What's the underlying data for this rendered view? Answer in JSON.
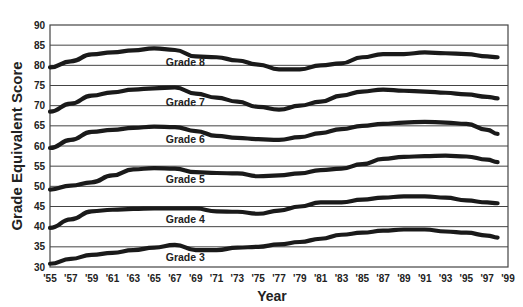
{
  "chart_data": {
    "type": "line",
    "title": "",
    "xlabel": "Year",
    "ylabel": "Grade Equivalent Score",
    "ylim": [
      30,
      90
    ],
    "yticks": [
      30,
      35,
      40,
      45,
      50,
      55,
      60,
      65,
      70,
      75,
      80,
      85,
      90
    ],
    "xticks": [
      "'55",
      "'57",
      "'59",
      "'61",
      "'63",
      "'65",
      "'67",
      "'69",
      "'71",
      "'73",
      "'75",
      "'77",
      "'79",
      "'81",
      "'83",
      "'85",
      "'87",
      "'89",
      "'91",
      "'93",
      "'95",
      "'97",
      "'99"
    ],
    "xlim": [
      1955,
      1999
    ],
    "grid": "horizontal",
    "legend": "inline labels",
    "x": [
      1955,
      1957,
      1959,
      1961,
      1963,
      1965,
      1967,
      1969,
      1971,
      1973,
      1975,
      1977,
      1979,
      1981,
      1983,
      1985,
      1987,
      1989,
      1991,
      1993,
      1995,
      1997,
      1998
    ],
    "series": [
      {
        "name": "Grade 8",
        "label_pos": [
          1968,
          80.8
        ],
        "values": [
          79.5,
          81,
          82.7,
          83.2,
          83.7,
          84.2,
          83.8,
          82.2,
          82,
          81.2,
          80.2,
          79,
          79,
          80,
          80.5,
          82,
          82.8,
          82.8,
          83.2,
          83,
          82.8,
          82.2,
          82
        ]
      },
      {
        "name": "Grade 7",
        "label_pos": [
          1968,
          71
        ],
        "values": [
          68.5,
          70.5,
          72.5,
          73.3,
          74,
          74.3,
          74.5,
          73,
          72,
          71,
          69.7,
          69,
          70,
          71,
          72.5,
          73.5,
          74,
          73.7,
          73.5,
          73.2,
          72.8,
          72.2,
          71.8
        ]
      },
      {
        "name": "Grade 6",
        "label_pos": [
          1968,
          61.8
        ],
        "values": [
          59.5,
          61.5,
          63.5,
          64,
          64.5,
          64.8,
          64.7,
          63.7,
          62.5,
          62,
          61.7,
          61.5,
          62.2,
          63.2,
          64.2,
          65,
          65.5,
          65.8,
          66,
          65.8,
          65.5,
          64,
          63
        ]
      },
      {
        "name": "Grade 5",
        "label_pos": [
          1968,
          51.8
        ],
        "values": [
          49.2,
          50.2,
          51,
          52.7,
          54.2,
          54.5,
          54.4,
          53.5,
          53.3,
          53.2,
          52.5,
          52.7,
          53.2,
          54,
          54.4,
          55.5,
          56.8,
          57.3,
          57.5,
          57.6,
          57.4,
          56.6,
          56
        ]
      },
      {
        "name": "Grade 4",
        "label_pos": [
          1968,
          42
        ],
        "values": [
          39.7,
          41.8,
          43.8,
          44.2,
          44.4,
          44.5,
          44.5,
          44.5,
          43.8,
          43.7,
          43.2,
          44,
          45,
          46,
          46,
          46.7,
          47.2,
          47.5,
          47.5,
          47.2,
          46.5,
          46,
          45.8
        ]
      },
      {
        "name": "Grade 3",
        "label_pos": [
          1968,
          32.5
        ],
        "values": [
          30.8,
          32,
          33,
          33.5,
          34.2,
          34.8,
          35.5,
          34.2,
          34.2,
          34.8,
          35,
          35.6,
          36.2,
          37,
          38,
          38.5,
          39,
          39.3,
          39.3,
          38.8,
          38.5,
          37.8,
          37.3
        ]
      }
    ]
  },
  "colors": {
    "line": "#1a1a1a",
    "grid": "#444444",
    "text": "#222222"
  }
}
